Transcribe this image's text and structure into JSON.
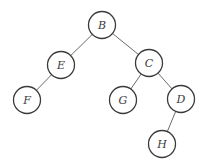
{
  "diagram": {
    "type": "binary-tree",
    "style": {
      "background": "#ffffff",
      "node_stroke": "#3a3a3a",
      "node_fill": "#ffffff",
      "edge_stroke": "#6a6a6a",
      "label_color": "#3a3a3a",
      "node_radius": 13.5
    },
    "nodes": [
      {
        "id": "B",
        "label": "B",
        "x": 102,
        "y": 25
      },
      {
        "id": "E",
        "label": "E",
        "x": 61,
        "y": 65
      },
      {
        "id": "C",
        "label": "C",
        "x": 149,
        "y": 63
      },
      {
        "id": "F",
        "label": "F",
        "x": 27,
        "y": 100
      },
      {
        "id": "G",
        "label": "G",
        "x": 123,
        "y": 100
      },
      {
        "id": "D",
        "label": "D",
        "x": 181,
        "y": 99
      },
      {
        "id": "H",
        "label": "H",
        "x": 162,
        "y": 144
      }
    ],
    "edges": [
      {
        "from": "B",
        "to": "E"
      },
      {
        "from": "B",
        "to": "C"
      },
      {
        "from": "E",
        "to": "F"
      },
      {
        "from": "C",
        "to": "G"
      },
      {
        "from": "C",
        "to": "D"
      },
      {
        "from": "D",
        "to": "H"
      }
    ]
  }
}
